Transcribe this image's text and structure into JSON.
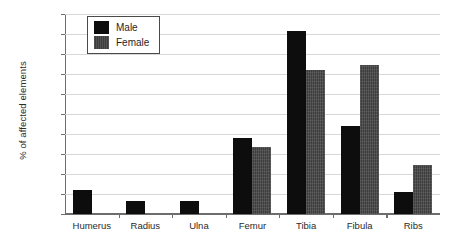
{
  "chart_data": {
    "type": "bar",
    "title": "",
    "xlabel": "",
    "ylabel": "% of affected elements",
    "ylim": [
      0,
      20
    ],
    "ytick_step": 2,
    "yticks": [
      0,
      2,
      4,
      6,
      8,
      10,
      12,
      14,
      16,
      18,
      20
    ],
    "categories": [
      "Humerus",
      "Radius",
      "Ulna",
      "Femur",
      "Tibia",
      "Fibula",
      "Ribs"
    ],
    "series": [
      {
        "name": "Male",
        "color": "#0d0d0d",
        "values": [
          2.4,
          1.3,
          1.3,
          7.65,
          18.3,
          8.8,
          2.2
        ]
      },
      {
        "name": "Female",
        "color": "#3d3d3d",
        "values": [
          0,
          0,
          0,
          6.75,
          14.4,
          14.9,
          4.9
        ]
      }
    ],
    "grid": true,
    "grid_color": "#d8d8d8",
    "legend_position": "top-left-inside",
    "axis_color": "#6d6d6d",
    "background": "#ffffff"
  },
  "legend": {
    "items": [
      {
        "label": "Male"
      },
      {
        "label": "Female"
      }
    ]
  },
  "axis": {
    "y_title": "% of affected elements",
    "tick_0": "0",
    "tick_2": "2",
    "tick_4": "4",
    "tick_6": "6",
    "tick_8": "8",
    "tick_10": "10",
    "tick_12": "12",
    "tick_14": "14",
    "tick_16": "16",
    "tick_18": "18",
    "tick_20": "20"
  }
}
